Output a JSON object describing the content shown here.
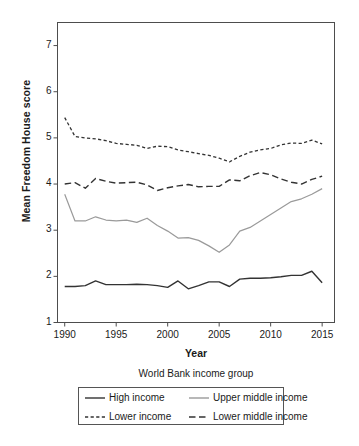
{
  "chart_data": {
    "type": "line",
    "title": "",
    "xlabel": "Year",
    "ylabel": "Mean Freedom House score",
    "xlim": [
      1989.3,
      2016.2
    ],
    "ylim": [
      1,
      7.5
    ],
    "xticks": [
      1990,
      1995,
      2000,
      2005,
      2010,
      2015
    ],
    "yticks": [
      1,
      2,
      3,
      4,
      5,
      6,
      7
    ],
    "grid": false,
    "legend_position": "below-axes",
    "legend_title": "World Bank income group",
    "x": [
      1990,
      1991,
      1992,
      1993,
      1994,
      1995,
      1996,
      1997,
      1998,
      1999,
      2000,
      2001,
      2002,
      2003,
      2004,
      2005,
      2006,
      2007,
      2008,
      2009,
      2010,
      2011,
      2012,
      2013,
      2014,
      2015
    ],
    "series": [
      {
        "name": "High income",
        "style": "solid",
        "color": "#333333",
        "width": 1.4,
        "values": [
          1.78,
          1.78,
          1.8,
          1.9,
          1.82,
          1.82,
          1.82,
          1.83,
          1.82,
          1.8,
          1.76,
          1.9,
          1.73,
          1.8,
          1.88,
          1.88,
          1.78,
          1.94,
          1.96,
          1.96,
          1.97,
          1.99,
          2.02,
          2.02,
          2.11,
          1.86
        ]
      },
      {
        "name": "Upper middle income",
        "style": "solid",
        "color": "#9a9a9a",
        "width": 1.2,
        "values": [
          3.78,
          3.2,
          3.2,
          3.29,
          3.22,
          3.2,
          3.22,
          3.17,
          3.26,
          3.1,
          2.98,
          2.83,
          2.84,
          2.78,
          2.66,
          2.52,
          2.68,
          2.98,
          3.06,
          3.2,
          3.34,
          3.48,
          3.62,
          3.68,
          3.78,
          3.9
        ]
      },
      {
        "name": "Lower income",
        "style": "dotted",
        "color": "#333333",
        "width": 1.3,
        "values": [
          5.44,
          5.03,
          5.0,
          4.98,
          4.94,
          4.88,
          4.86,
          4.84,
          4.77,
          4.82,
          4.81,
          4.74,
          4.7,
          4.66,
          4.62,
          4.56,
          4.48,
          4.6,
          4.69,
          4.74,
          4.77,
          4.85,
          4.89,
          4.88,
          4.95,
          4.87
        ]
      },
      {
        "name": "Lower middle income",
        "style": "dashed",
        "color": "#333333",
        "width": 1.4,
        "values": [
          4.0,
          4.03,
          3.91,
          4.12,
          4.06,
          4.02,
          4.03,
          4.04,
          3.98,
          3.86,
          3.92,
          3.96,
          3.99,
          3.94,
          3.95,
          3.95,
          4.09,
          4.07,
          4.18,
          4.25,
          4.2,
          4.11,
          4.04,
          4.0,
          4.1,
          4.17
        ]
      }
    ]
  },
  "legend": {
    "title": "World Bank income group",
    "items": [
      {
        "label": "High income",
        "style": "solid",
        "color": "#333333"
      },
      {
        "label": "Upper middle income",
        "style": "solid",
        "color": "#9a9a9a"
      },
      {
        "label": "Lower income",
        "style": "dotted",
        "color": "#333333"
      },
      {
        "label": "Lower middle income",
        "style": "dashed",
        "color": "#333333"
      }
    ]
  },
  "axes": {
    "x_title": "Year",
    "y_title": "Mean Freedom House score"
  }
}
